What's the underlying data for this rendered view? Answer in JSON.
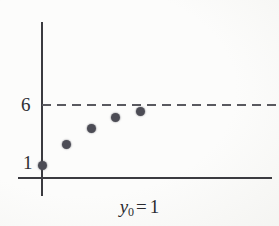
{
  "figure": {
    "background_color": "#fcfcfb",
    "caption": {
      "variable": "y",
      "subscript": "0",
      "equals": "=",
      "value": "1",
      "full_text": "y0 = 1"
    },
    "panel_label": "("
  },
  "chart_data": {
    "type": "scatter",
    "title": "",
    "subtitle": "",
    "xlabel": "",
    "ylabel": "",
    "annotation": "y0 = 1",
    "grid": false,
    "legend": null,
    "axis_color": "#3b3b40",
    "point_color": "#4c4c55",
    "asymptote_color": "#59595f",
    "x": [
      0,
      1,
      2,
      3,
      4
    ],
    "values": [
      1,
      2.7,
      4.0,
      4.9,
      5.4
    ],
    "series": [
      {
        "name": "iterates",
        "x": [
          0,
          1,
          2,
          3,
          4
        ],
        "values": [
          1,
          2.7,
          4.0,
          4.9,
          5.4
        ]
      }
    ],
    "ytick_labels": [
      "1",
      "6"
    ],
    "ytick_values": [
      1,
      6
    ],
    "xtick_labels": [],
    "ylim": [
      0,
      7.6
    ],
    "xlim": [
      -0.35,
      9.2
    ],
    "reference_lines": [
      {
        "name": "asymptote",
        "orientation": "horizontal",
        "value": 6,
        "style": "dashed",
        "label": "6"
      }
    ]
  }
}
